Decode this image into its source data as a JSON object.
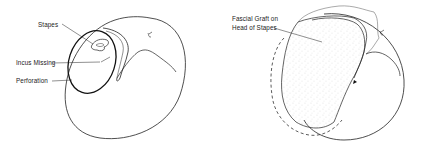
{
  "figure": {
    "left_panel": {
      "title": "Before repair",
      "labels": {
        "stapes": "Stapes",
        "incus_missing": "Incus Missing",
        "perforation": "Perforation"
      }
    },
    "right_panel": {
      "title": "After repair",
      "labels": {
        "graft_line1": "Fascial Graft on",
        "graft_line2": "Head of Stapes"
      }
    },
    "colors": {
      "line": "#222222",
      "background": "#ffffff",
      "stipple": "#888888"
    }
  }
}
